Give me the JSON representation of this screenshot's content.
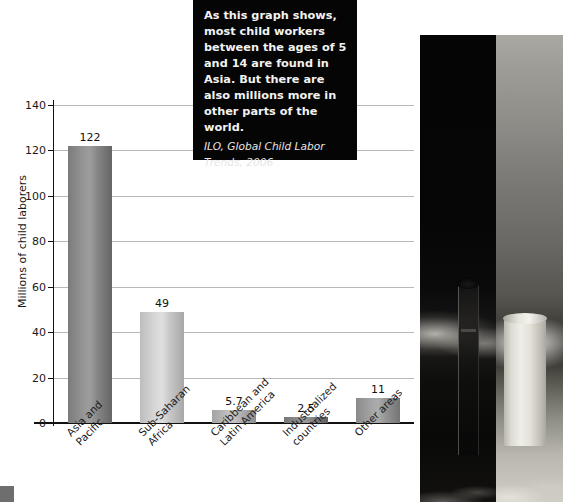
{
  "chart_data": {
    "type": "bar",
    "title": "",
    "xlabel": "",
    "ylabel": "Millions of child laborers",
    "ylim": [
      0,
      140
    ],
    "yticks": [
      0,
      20,
      40,
      60,
      80,
      100,
      120,
      140
    ],
    "grid": true,
    "legend": "none",
    "categories": [
      "Asia and Pacific",
      "Sub-Saharan Africa",
      "Caribbean and Latin America",
      "Industrialized countries",
      "Other areas"
    ],
    "category_lines": [
      [
        "Asia and",
        "Pacific"
      ],
      [
        "Sub-Saharan",
        "Africa"
      ],
      [
        "Caribbean and",
        "Latin America"
      ],
      [
        "Industrialized",
        "countries"
      ],
      [
        "Other areas"
      ]
    ],
    "values": [
      122,
      49,
      5.7,
      2.5,
      11
    ],
    "value_labels": [
      "122",
      "49",
      "5.7",
      "2.5",
      "11"
    ],
    "bar_colors": [
      "#7b7b7b",
      "#bdbdbd",
      "#a3a3a3",
      "#767676",
      "#8a8a8a"
    ]
  },
  "callout": {
    "body": "As this graph shows, most child workers between the ages of 5 and 14 are found in Asia. But there are also millions more in other parts of the world.",
    "source": "ILO, Global Child Labor Trends, 2006"
  },
  "photos": {
    "dark_caption": "child-labor-photo-dark",
    "light_caption": "child-labor-photo-light"
  }
}
